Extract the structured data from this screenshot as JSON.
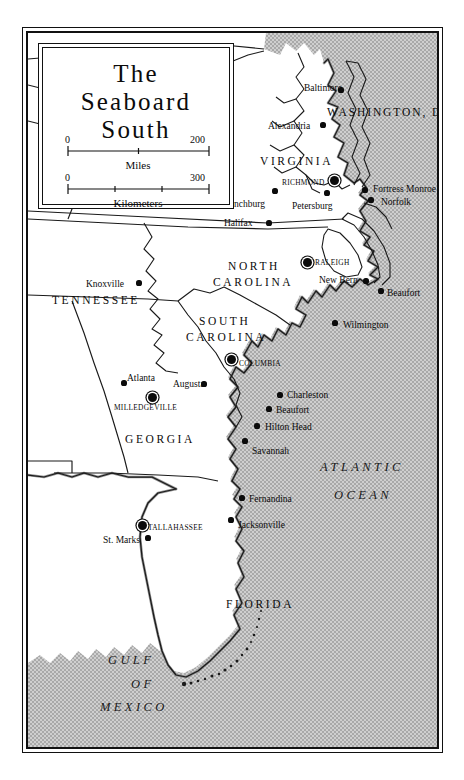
{
  "title": {
    "line1": "The",
    "line2": "Seaboard",
    "line3": "South"
  },
  "scale": {
    "miles": {
      "start": "0",
      "end": "200",
      "caption": "Miles"
    },
    "kilometers": {
      "start": "0",
      "end": "300",
      "caption": "Kilometers"
    }
  },
  "states": [
    {
      "name": "VIRGINIA",
      "x": 232,
      "y": 123
    },
    {
      "name": "NORTH",
      "x": 200,
      "y": 228
    },
    {
      "name": "CAROLINA",
      "x": 185,
      "y": 244
    },
    {
      "name": "TENNESSEE",
      "x": 24,
      "y": 262
    },
    {
      "name": "SOUTH",
      "x": 171,
      "y": 283
    },
    {
      "name": "CAROLINA",
      "x": 158,
      "y": 299
    },
    {
      "name": "GEORGIA",
      "x": 97,
      "y": 401
    },
    {
      "name": "FLORIDA",
      "x": 198,
      "y": 566
    }
  ],
  "district": {
    "name": "WASHINGTON, D.C.",
    "x": 299,
    "y": 74
  },
  "waters": [
    {
      "name": "ATLANTIC",
      "x": 292,
      "y": 428
    },
    {
      "name": "OCEAN",
      "x": 306,
      "y": 456
    },
    {
      "name": "GULF",
      "x": 80,
      "y": 621
    },
    {
      "name": "OF",
      "x": 103,
      "y": 645
    },
    {
      "name": "MEXICO",
      "x": 72,
      "y": 668
    }
  ],
  "cities": [
    {
      "name": "Baltimore",
      "x": 276,
      "y": 51,
      "dot_x": 313,
      "dot_y": 57,
      "type": "city",
      "anchor": "left"
    },
    {
      "name": "Alexandria",
      "x": 240,
      "y": 89,
      "dot_x": 295,
      "dot_y": 92,
      "type": "city",
      "anchor": "left"
    },
    {
      "name": "RICHMOND",
      "x": 254,
      "y": 146,
      "dot_x": 306,
      "dot_y": 147,
      "type": "capital",
      "anchor": "left"
    },
    {
      "name": "Lynchburg",
      "x": 196,
      "y": 167,
      "dot_x": 247,
      "dot_y": 158,
      "type": "city",
      "anchor": "left"
    },
    {
      "name": "Petersburg",
      "x": 264,
      "y": 169,
      "dot_x": 299,
      "dot_y": 160,
      "type": "city",
      "anchor": "left"
    },
    {
      "name": "Fortress Monroe",
      "x": 345,
      "y": 152,
      "dot_x": 337,
      "dot_y": 157,
      "type": "city",
      "anchor": "left"
    },
    {
      "name": "Norfolk",
      "x": 353,
      "y": 165,
      "dot_x": 343,
      "dot_y": 167,
      "type": "city",
      "anchor": "left"
    },
    {
      "name": "Halifax",
      "x": 196,
      "y": 186,
      "dot_x": 241,
      "dot_y": 190,
      "type": "city",
      "anchor": "left"
    },
    {
      "name": "Knoxville",
      "x": 58,
      "y": 247,
      "dot_x": 111,
      "dot_y": 250,
      "type": "city",
      "anchor": "left"
    },
    {
      "name": "RALEIGH",
      "x": 287,
      "y": 226,
      "dot_x": 279,
      "dot_y": 229,
      "type": "capital",
      "anchor": "left"
    },
    {
      "name": "New Bern",
      "x": 291,
      "y": 243,
      "dot_x": 338,
      "dot_y": 248,
      "type": "city",
      "anchor": "left"
    },
    {
      "name": "Beaufort",
      "x": 359,
      "y": 256,
      "dot_x": 353,
      "dot_y": 258,
      "type": "city",
      "anchor": "left"
    },
    {
      "name": "Wilmington",
      "x": 315,
      "y": 288,
      "dot_x": 307,
      "dot_y": 290,
      "type": "city",
      "anchor": "left"
    },
    {
      "name": "COLUMBIA",
      "x": 211,
      "y": 327,
      "dot_x": 203,
      "dot_y": 326,
      "type": "capital",
      "anchor": "left"
    },
    {
      "name": "Atlanta",
      "x": 99,
      "y": 341,
      "dot_x": 96,
      "dot_y": 350,
      "type": "city",
      "anchor": "left"
    },
    {
      "name": "Augusta",
      "x": 145,
      "y": 347,
      "dot_x": 176,
      "dot_y": 351,
      "type": "city",
      "anchor": "left"
    },
    {
      "name": "Charleston",
      "x": 259,
      "y": 358,
      "dot_x": 252,
      "dot_y": 362,
      "type": "city",
      "anchor": "left"
    },
    {
      "name": "Beaufort",
      "x": 248,
      "y": 373,
      "dot_x": 241,
      "dot_y": 376,
      "type": "city",
      "anchor": "left"
    },
    {
      "name": "MILLEDGEVILLE",
      "x": 86,
      "y": 371,
      "dot_x": 124,
      "dot_y": 364,
      "type": "capital",
      "anchor": "left"
    },
    {
      "name": "Hilton Head",
      "x": 237,
      "y": 390,
      "dot_x": 229,
      "dot_y": 393,
      "type": "city",
      "anchor": "left"
    },
    {
      "name": "Savannah",
      "x": 224,
      "y": 414,
      "dot_x": 217,
      "dot_y": 408,
      "type": "city",
      "anchor": "left"
    },
    {
      "name": "Fernandina",
      "x": 221,
      "y": 462,
      "dot_x": 214,
      "dot_y": 465,
      "type": "city",
      "anchor": "left"
    },
    {
      "name": "TALLAHASSEE",
      "x": 120,
      "y": 491,
      "dot_x": 114,
      "dot_y": 492,
      "type": "capital",
      "anchor": "left"
    },
    {
      "name": "Jacksonville",
      "x": 210,
      "y": 488,
      "dot_x": 203,
      "dot_y": 487,
      "type": "city",
      "anchor": "left"
    },
    {
      "name": "St. Marks",
      "x": 75,
      "y": 503,
      "dot_x": 120,
      "dot_y": 505,
      "type": "city",
      "anchor": "left"
    },
    {
      "name": "Key West",
      "x": 196,
      "y": 719,
      "dot_x": 238,
      "dot_y": 724,
      "type": "city",
      "anchor": "left"
    }
  ],
  "colors": {
    "ink": "#0b0b0b",
    "land": "#ffffff",
    "ocean_stipple": "#b9b9b9",
    "coast_shade": "#8a8a8a",
    "page": "#ffffff"
  }
}
